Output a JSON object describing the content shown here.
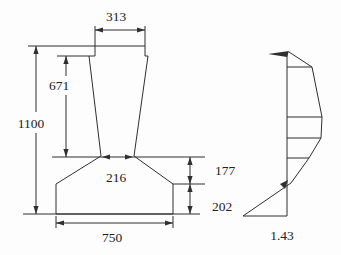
{
  "colors": {
    "line": "#2f2f2f",
    "text": "#222222",
    "background": "#fdfdfd"
  },
  "pier_drawing": {
    "labels": {
      "cap_width": "313",
      "shaft_height": "671",
      "total_height": "1100",
      "neck_width": "216",
      "haunch_height": "177",
      "footing_height": "202",
      "footing_width": "750"
    }
  },
  "stress_profile": {
    "base_value": "1.43"
  }
}
